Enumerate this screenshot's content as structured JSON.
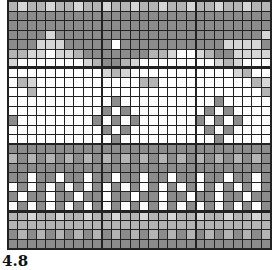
{
  "caption": "4.8",
  "grid": {
    "cols": 28,
    "rows": 26,
    "thick_cols": [
      10,
      20
    ],
    "thick_rows": [
      7,
      15,
      22
    ],
    "legend": {
      "d": "#8c8c8c",
      "m": "#b4b4b4",
      "l": "#d6d6d6",
      "w": "#ffffff"
    },
    "pattern": [
      "mlmmlmmlmmlmmlmmlmmlmmlmmlmm",
      "dddddddddddddddddddddddddddd",
      "dddddddddddddddddddddddddddd",
      "ddddlddddddddddddddddddddddl",
      "dddllldddddwdddddddddddlllld",
      "mmllwllmdddddddmmlwwlmddllll",
      "lwwwwwwwlmddmlwwwwwwwwlmlwww",
      "wwwwwwwwwwlmlwwwwwwwwwwwlmww",
      "wmlwwwwwwwwwwwmmwwwwwwwwwwml",
      "wwmwwwwwwwwwwwwwwwwwwwwwwwwm",
      "wwwwwwwwwwwdwwwwwwwwwwdwwwww",
      "wwwwwwwwwwdwdwwwwwwwwdwdwwww",
      "dwwwwwwwwdwdwdwwwwwwdwdwdwww",
      "wwwwwwwwwwdwdwwwwwwwwdwdwwww",
      "wwwwwwwwwwwdwwwwwwwwwwdwwwww",
      "dddddddddddddddddddddddddddd",
      "mdmdmdmdmdmdmdmdmdmdmdmdmdmd",
      "dddddddddddddddddddddddddddd",
      "ddwddwddwddwddwddwddwddwddwd",
      "wdwdwdwdwdwdwdwdwdwdwdwdwdwd",
      "dwddwddwddwddwddwddwddwddwdd",
      "wdwdwdwdwdwdwdwdwdwdwdwdwdwd",
      "mmlmmlmmlmmlmmlmmlmmlmmlmmlm",
      "mmmmmmmmmmmmmmmmmmmmmmmmmmmm",
      "dmdmdmdmdmdmdmdmdmdmdmdmdmdm",
      "dddddddddddddddddddddddddddd"
    ]
  }
}
